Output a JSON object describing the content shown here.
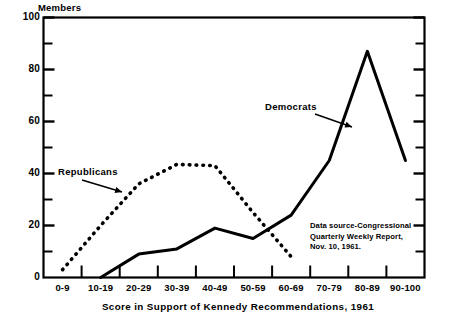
{
  "chart_data": {
    "type": "line",
    "title": "",
    "xlabel": "Score in Support of Kennedy Recommendations, 1961",
    "ylabel": "Members",
    "categories": [
      "0-9",
      "10-19",
      "20-29",
      "30-39",
      "40-49",
      "50-59",
      "60-69",
      "70-79",
      "80-89",
      "90-100"
    ],
    "ylim": [
      0,
      100
    ],
    "xlim_categories": 10,
    "y_major_ticks": [
      0,
      20,
      40,
      60,
      80,
      100
    ],
    "y_minor_ticks": [
      10,
      30,
      50,
      70,
      90
    ],
    "grid": false,
    "legend": "inline-annotations",
    "series": [
      {
        "name": "Republicans",
        "style": "dashed",
        "color": "#000000",
        "x": [
          "0-9",
          "10-19",
          "20-29",
          "30-39",
          "40-49",
          "50-59",
          "60-69"
        ],
        "values": [
          3,
          20,
          36,
          43.5,
          43,
          25,
          8
        ]
      },
      {
        "name": "Democrats",
        "style": "solid",
        "color": "#000000",
        "x": [
          "10-19",
          "20-29",
          "30-39",
          "40-49",
          "50-59",
          "60-69",
          "70-79",
          "80-89",
          "90-100"
        ],
        "values": [
          0,
          9,
          11,
          19,
          15,
          24,
          45,
          87,
          45
        ]
      }
    ],
    "annotations": [
      {
        "name": "republicans-label",
        "text": "Republicans",
        "target_series": "Republicans"
      },
      {
        "name": "democrats-label",
        "text": "Democrats",
        "target_series": "Democrats"
      }
    ],
    "source_note": {
      "line1": "Data source-Congressional",
      "line2": "Quarterly Weekly Report,",
      "line3": "Nov. 10, 1961."
    }
  },
  "y_tick_labels": [
    "100",
    "80",
    "60",
    "40",
    "20",
    "0"
  ]
}
